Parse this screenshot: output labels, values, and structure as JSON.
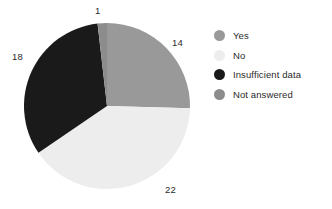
{
  "chart_data": {
    "type": "pie",
    "title": "",
    "labels": [
      "Yes",
      "No",
      "Insufficient data",
      "Not answered"
    ],
    "values": [
      14,
      22,
      18,
      1
    ],
    "total": 55,
    "colors": [
      "#999999",
      "#ededed",
      "#1a1a1a",
      "#8c8c8c"
    ],
    "start_angle_deg": 0,
    "direction": "clockwise",
    "legend_position": "right",
    "grid": false,
    "xlabel": "",
    "ylabel": "",
    "data_labels": [
      {
        "text": "14",
        "slice": "Yes"
      },
      {
        "text": "22",
        "slice": "No"
      },
      {
        "text": "18",
        "slice": "Insufficient data"
      },
      {
        "text": "1",
        "slice": "Not answered"
      }
    ]
  },
  "legend": {
    "items": [
      {
        "label": "Yes",
        "color": "#999999"
      },
      {
        "label": "No",
        "color": "#ededed"
      },
      {
        "label": "Insufficient data",
        "color": "#1a1a1a"
      },
      {
        "label": "Not answered",
        "color": "#8c8c8c"
      }
    ]
  },
  "labels": {
    "top": "1",
    "right": "14",
    "left": "18",
    "bottom": "22"
  }
}
